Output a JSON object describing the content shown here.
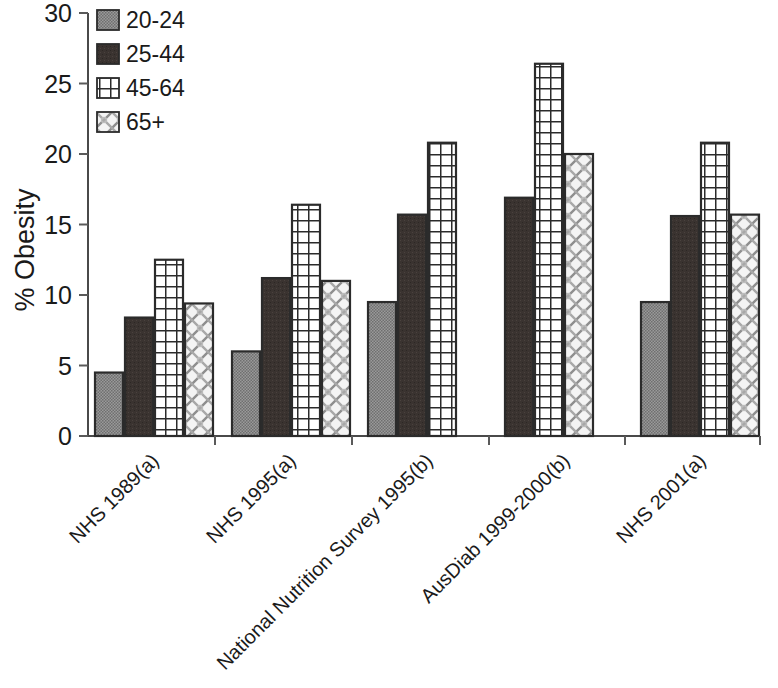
{
  "chart_data": {
    "type": "bar",
    "title": "",
    "xlabel": "",
    "ylabel": "% Obesity",
    "ylim": [
      0,
      30
    ],
    "yticks": [
      0,
      5,
      10,
      15,
      20,
      25,
      30
    ],
    "ytick_labels": [
      "0",
      "5",
      "10",
      "15",
      "20",
      "25",
      "30"
    ],
    "grid": false,
    "legend_position": "top-left",
    "categories": [
      "NHS 1989(a)",
      "NHS 1995(a)",
      "National Nutrition Survey 1995(b)",
      "AusDiab 1999-2000(b)",
      "NHS 2001(a)"
    ],
    "series": [
      {
        "name": "20-24",
        "fill": "gray-stipple",
        "color": "#8c8c8c",
        "values": [
          4.5,
          6.0,
          9.5,
          null,
          9.5
        ]
      },
      {
        "name": "25-44",
        "fill": "dark-solid",
        "color": "#3a3330",
        "values": [
          8.4,
          11.2,
          15.7,
          16.9,
          15.6
        ]
      },
      {
        "name": "45-64",
        "fill": "grid-crosshatch",
        "color": "#ffffff",
        "values": [
          12.5,
          16.4,
          20.8,
          26.4,
          20.8
        ]
      },
      {
        "name": "65+",
        "fill": "scale-hatch",
        "color": "#f2f2f2",
        "values": [
          9.4,
          11.0,
          null,
          20.0,
          15.7
        ]
      }
    ]
  },
  "legend": {
    "items": [
      {
        "label": "20-24",
        "swatch": "gray-stipple"
      },
      {
        "label": "25-44",
        "swatch": "dark-solid"
      },
      {
        "label": "45-64",
        "swatch": "grid-crosshatch"
      },
      {
        "label": "65+",
        "swatch": "scale-hatch"
      }
    ]
  },
  "colors": {
    "axis": "#4a4a4a",
    "text": "#1a1a1a",
    "bar_outline": "#2b2b2b",
    "background": "#ffffff"
  }
}
